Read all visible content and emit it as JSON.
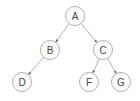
{
  "diagram": {
    "type": "tree",
    "nodes": [
      {
        "id": "A",
        "label": "A",
        "x": 75,
        "y": 16
      },
      {
        "id": "B",
        "label": "B",
        "x": 50,
        "y": 50
      },
      {
        "id": "C",
        "label": "C",
        "x": 103,
        "y": 50
      },
      {
        "id": "D",
        "label": "D",
        "x": 22,
        "y": 82
      },
      {
        "id": "F",
        "label": "F",
        "x": 89,
        "y": 82
      },
      {
        "id": "G",
        "label": "G",
        "x": 121,
        "y": 82
      }
    ],
    "edges": [
      {
        "from": "A",
        "to": "B"
      },
      {
        "from": "A",
        "to": "C"
      },
      {
        "from": "B",
        "to": "D"
      },
      {
        "from": "C",
        "to": "F"
      },
      {
        "from": "C",
        "to": "G"
      }
    ],
    "style": {
      "node_radius": 9.5,
      "node_stroke": "#9a9a9a",
      "node_fill": "#ffffff",
      "edge_color": "#9a9a9a",
      "label_color": "#444444"
    }
  }
}
